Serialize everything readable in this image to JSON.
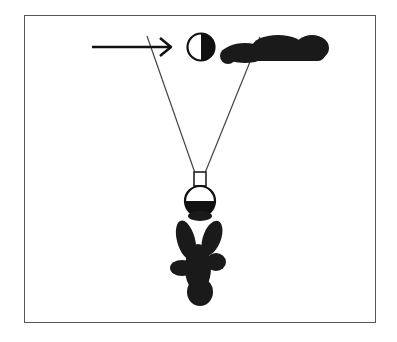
{
  "diagram": {
    "type": "schematic-illustration",
    "elements": [
      {
        "id": "arrow",
        "kind": "arrow",
        "direction": "right",
        "label": ""
      },
      {
        "id": "top-symbol",
        "kind": "half-filled-circle",
        "fill_side": "right"
      },
      {
        "id": "redacted-label",
        "kind": "redacted-text",
        "label": ""
      },
      {
        "id": "left-line",
        "kind": "line"
      },
      {
        "id": "right-line",
        "kind": "line"
      },
      {
        "id": "connector",
        "kind": "rectangle"
      },
      {
        "id": "bottom-symbol",
        "kind": "half-filled-circle",
        "fill_side": "bottom"
      },
      {
        "id": "redacted-figure",
        "kind": "redacted-shape"
      }
    ]
  },
  "colors": {
    "ink": "#111111",
    "line": "#444444",
    "frame": "#555555",
    "background": "#ffffff"
  }
}
